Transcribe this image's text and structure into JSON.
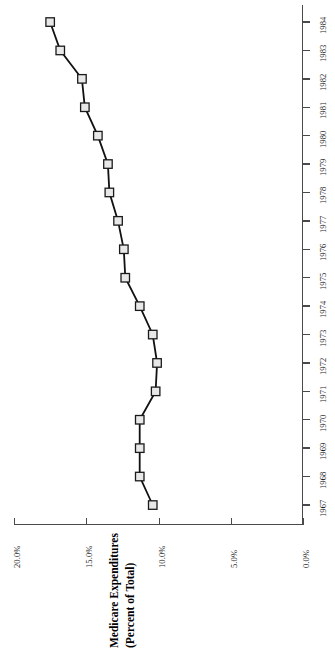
{
  "chart_data": {
    "type": "line",
    "title": "",
    "subtitle": "",
    "orientation": "rotated-90",
    "xlabel": "",
    "ylabel": "Medicare Expenditures (Percent of Total)",
    "ylabel_line1": "Medicare Expenditures",
    "ylabel_line2": "(Percent of Total)",
    "categories": [
      "1967",
      "1968",
      "1969",
      "1970",
      "1971",
      "1972",
      "1973",
      "1974",
      "1975",
      "1976",
      "1977",
      "1978",
      "1979",
      "1980",
      "1981",
      "1982",
      "1983",
      "1984"
    ],
    "values": [
      10.4,
      11.3,
      11.3,
      11.3,
      10.2,
      10.1,
      10.4,
      11.3,
      12.3,
      12.4,
      12.8,
      13.4,
      13.5,
      14.2,
      15.1,
      15.3,
      16.8,
      17.5
    ],
    "value_labels": [
      "10.4%",
      "11.3%",
      "11.3%",
      "11.3%",
      "10.2%",
      "10.1%",
      "10.4%",
      "11.3%",
      "12.3%",
      "12.4%",
      "12.8%",
      "13.4%",
      "13.5%",
      "14.2%",
      "15.1%",
      "15.3%",
      "16.8%",
      "17.5%"
    ],
    "ylim": [
      0,
      20
    ],
    "ytick_values": [
      0,
      5,
      10,
      15,
      20
    ],
    "ytick_labels": [
      "0.0%",
      "5.0%",
      "10.0%",
      "15.0%",
      "20.0%"
    ],
    "xtick_labels": [
      "1967",
      "1968",
      "1969",
      "1970",
      "1971",
      "1972",
      "1973",
      "1974",
      "1975",
      "1976",
      "1977",
      "1978",
      "1979",
      "1980",
      "1981",
      "1982",
      "1983",
      "1984"
    ],
    "grid": false,
    "legend": false,
    "legend_position": "none",
    "marker": "square",
    "marker_fill": "#e8e8e8",
    "marker_edge": "#1a1a1a",
    "line_color": "#111111",
    "axis_color": "#3a3a3a"
  }
}
